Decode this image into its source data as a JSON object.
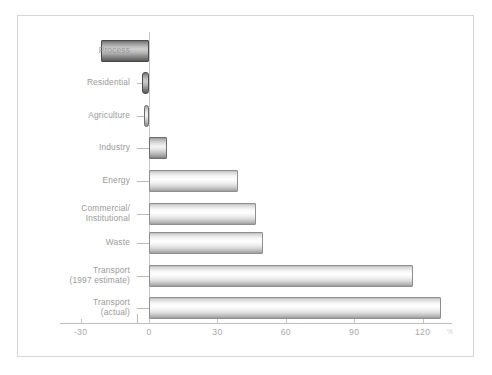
{
  "chart_data": {
    "type": "bar",
    "orientation": "horizontal",
    "title": "",
    "subtitle": "",
    "xlabel": "%",
    "ylabel": "",
    "categories": [
      "Process",
      "Residential",
      "Agriculture",
      "Industry",
      "Energy",
      "Commercial/\nInstitutional",
      "Waste",
      "Transport\n(1997 estimate)",
      "Transport\n(actual)"
    ],
    "values": [
      -21,
      -3,
      -2,
      8,
      39,
      47,
      50,
      116,
      128
    ],
    "xlim": [
      -30,
      135
    ],
    "xticks": [
      -30,
      0,
      30,
      60,
      90,
      120
    ],
    "xtick_labels": [
      "-30",
      "0",
      "30",
      "60",
      "90",
      "120"
    ],
    "grid": false,
    "legend": null,
    "axis_unit_symbol": "%",
    "bar_styles": [
      "dark",
      "dark",
      "mid",
      "mid",
      "light",
      "light",
      "light",
      "light",
      "light"
    ],
    "colors": {
      "bar_light_fill": "#ffffff",
      "bar_light_shadow": "#9e9e9e",
      "bar_dark_fill": "#cfcfcf",
      "bar_dark_shadow": "#555555",
      "bar_outline": "#8f8f8f",
      "axis": "#bdbdbd",
      "tick_text": "#a8a8a8",
      "category_text": "#9a9a9a",
      "frame_border": "#d6d6d6",
      "background": "#ffffff"
    }
  }
}
